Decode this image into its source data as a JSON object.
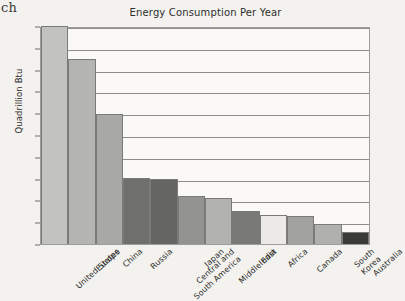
{
  "page_fragment": "ch",
  "axis": {
    "ylabel": "Quadrillion Btu",
    "yticks": [
      "0",
      "10",
      "20",
      "30",
      "40",
      "50",
      "60",
      "70",
      "80",
      "90",
      "100"
    ]
  },
  "chart_data": {
    "type": "bar",
    "title": "Energy Consumption Per Year",
    "xlabel": "",
    "ylabel": "Quadrillion Btu",
    "ylim": [
      0,
      100
    ],
    "ytick_step": 10,
    "grid": true,
    "legend": "none",
    "categories": [
      "United States",
      "Europe",
      "China",
      "Russia",
      "Central and\nSouth America",
      "Japan",
      "Middle East",
      "India",
      "Africa",
      "Canada",
      "South Korea",
      "Australia"
    ],
    "values": [
      100,
      85,
      59.5,
      30.5,
      30,
      22,
      21,
      15,
      13.5,
      13,
      9,
      5.5
    ],
    "bar_colors": [
      "#c2c2c0",
      "#b4b4b2",
      "#a8a8a6",
      "#6f6f6d",
      "#656563",
      "#939391",
      "#b2b2b0",
      "#797977",
      "#eceae6",
      "#a2a2a0",
      "#b0b0ae",
      "#3a3a38"
    ]
  }
}
